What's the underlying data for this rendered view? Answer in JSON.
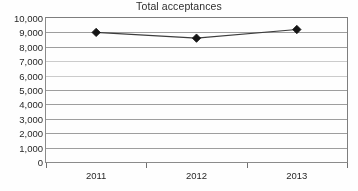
{
  "chart_data": {
    "type": "line",
    "title": "Total acceptances",
    "xlabel": "",
    "ylabel": "",
    "categories": [
      "2011",
      "2012",
      "2013"
    ],
    "series": [
      {
        "name": "Total acceptances",
        "values": [
          9000,
          8600,
          9200
        ],
        "marker": "diamond",
        "marker_color": "#111111",
        "line_color": "#3a3a3a"
      }
    ],
    "ylim": [
      0,
      10000
    ],
    "y_ticks": [
      0,
      1000,
      2000,
      3000,
      4000,
      5000,
      6000,
      7000,
      8000,
      9000,
      10000
    ],
    "y_tick_labels": [
      "0",
      "1,000",
      "2,000",
      "3,000",
      "4,000",
      "5,000",
      "6,000",
      "7,000",
      "8,000",
      "9,000",
      "10,000"
    ],
    "grid": true,
    "grid_color": "#8c8c8c",
    "legend": false,
    "legend_position": "none",
    "plot_border": true,
    "background_color": "#ffffff"
  }
}
